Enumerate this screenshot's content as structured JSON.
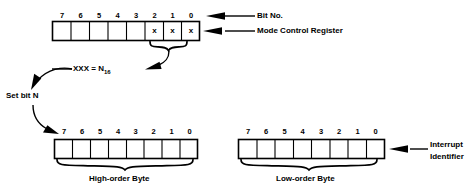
{
  "diagram": {
    "ink_color": "#000000",
    "background_color": "#ffffff"
  },
  "mode_control_register": {
    "name": "Mode Control Register",
    "bit_numbers": [
      "7",
      "6",
      "5",
      "4",
      "3",
      "2",
      "1",
      "0"
    ],
    "cells": [
      "",
      "",
      "",
      "",
      "",
      "x",
      "x",
      "x"
    ],
    "marked_bits": [
      "2",
      "1",
      "0"
    ],
    "mark_glyph": "x",
    "callouts": {
      "bit_no": "Bit No.",
      "register": "Mode Control Register"
    },
    "brace_label_prefix": "XXX = N",
    "brace_label_subscript": "16",
    "brace_label_full": "XXX = N16"
  },
  "set_bit": {
    "label": "Set bit N"
  },
  "high_order_byte": {
    "caption": "High-order Byte",
    "bit_numbers": [
      "7",
      "6",
      "5",
      "4",
      "3",
      "2",
      "1",
      "0"
    ],
    "cells": [
      "",
      "",
      "",
      "",
      "",
      "",
      "",
      ""
    ]
  },
  "low_order_byte": {
    "caption": "Low-order Byte",
    "bit_numbers": [
      "7",
      "6",
      "5",
      "4",
      "3",
      "2",
      "1",
      "0"
    ],
    "cells": [
      "",
      "",
      "",
      "",
      "",
      "",
      "",
      ""
    ],
    "callout_line1": "Interrupt",
    "callout_line2": "Identifier"
  }
}
